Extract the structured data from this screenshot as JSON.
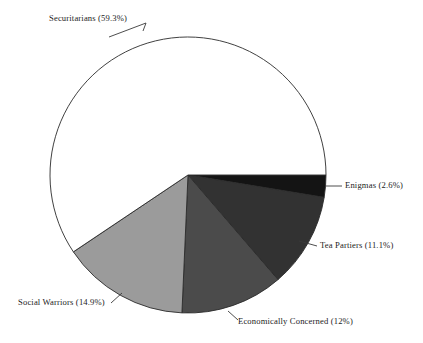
{
  "chart_data": {
    "type": "pie",
    "title": "",
    "subtitle": "",
    "xlabel": "",
    "ylabel": "",
    "legend_position": "none",
    "grid": false,
    "label_format": "name (percent%)",
    "start_angle_deg": 0,
    "direction": "clockwise",
    "center": {
      "x": 188,
      "y": 175
    },
    "radius": 138,
    "categories": [
      "Enigmas",
      "Tea Partiers",
      "Economically Concerned",
      "Social Warriors",
      "Securitarians"
    ],
    "values": [
      2.6,
      11.1,
      12,
      14.9,
      59.3
    ],
    "slices": [
      {
        "name": "Enigmas",
        "value": 2.6,
        "percent_text": "2.6%",
        "label": "Enigmas (2.6%)",
        "color": "#141414",
        "start_deg": 0,
        "end_deg": 9.36
      },
      {
        "name": "Tea Partiers",
        "value": 11.1,
        "percent_text": "11.1%",
        "label": "Tea Partiers (11.1%)",
        "color": "#323232",
        "start_deg": 9.36,
        "end_deg": 49.32
      },
      {
        "name": "Economically Concerned",
        "value": 12,
        "percent_text": "12%",
        "label": "Economically Concerned (12%)",
        "color": "#4b4b4b",
        "start_deg": 49.32,
        "end_deg": 92.52
      },
      {
        "name": "Social Warriors",
        "value": 14.9,
        "percent_text": "14.9%",
        "label": "Social Warriors (14.9%)",
        "color": "#9b9b9b",
        "start_deg": 92.52,
        "end_deg": 146.16
      },
      {
        "name": "Securitarians",
        "value": 59.3,
        "percent_text": "59.3%",
        "label": "Securitarians (59.3%)",
        "color": "#ffffff",
        "start_deg": 146.16,
        "end_deg": 360
      }
    ],
    "outline_color": "#2b2b2b",
    "background_color": "#ffffff",
    "text_color": "#1c1c1c"
  }
}
